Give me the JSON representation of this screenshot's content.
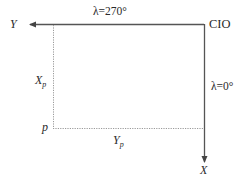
{
  "diagram": {
    "axes": {
      "y_axis_label": "Y",
      "x_axis_label": "X",
      "origin_label": "CIO",
      "y_axis_longitude": "λ=270°",
      "x_axis_longitude": "λ=0°"
    },
    "point": {
      "label": "p",
      "x_component": {
        "main": "X",
        "sub": "p"
      },
      "y_component": {
        "main": "Y",
        "sub": "p"
      }
    },
    "colors": {
      "axis_line": "#555555",
      "dotted_line": "#9a9a9a",
      "text": "#2a2a2a"
    }
  }
}
